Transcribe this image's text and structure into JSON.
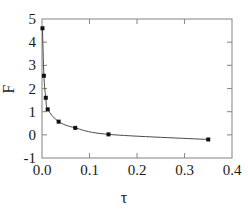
{
  "chart_data": {
    "type": "scatter",
    "title": "",
    "subtitle": "",
    "xlabel": "τ",
    "ylabel": "F",
    "xlim": [
      0.0,
      0.4
    ],
    "ylim": [
      -1,
      5
    ],
    "grid": false,
    "legend": null,
    "xticks": [
      0.0,
      0.1,
      0.2,
      0.3,
      0.4
    ],
    "xticklabels": [
      "0.0",
      "0.1",
      "0.2",
      "0.3",
      "0.4"
    ],
    "yticks": [
      -1,
      0,
      1,
      2,
      3,
      4,
      5
    ],
    "yticklabels": [
      "-1",
      "0",
      "1",
      "2",
      "3",
      "4",
      "5"
    ],
    "tick_direction": "in",
    "frame": "box",
    "marker": "square",
    "marker_color": "#111111",
    "line_color": "#4a4a4a",
    "background_color": "#ffffff",
    "frame_color": "#8d8d8d",
    "series": [
      {
        "name": "F vs tau",
        "x": [
          0.001,
          0.004,
          0.008,
          0.012,
          0.035,
          0.07,
          0.14,
          0.35
        ],
        "y": [
          4.6,
          2.55,
          1.6,
          1.1,
          0.57,
          0.3,
          0.02,
          -0.2
        ]
      }
    ]
  },
  "axis": {
    "x_title": "τ",
    "y_title": "F"
  }
}
